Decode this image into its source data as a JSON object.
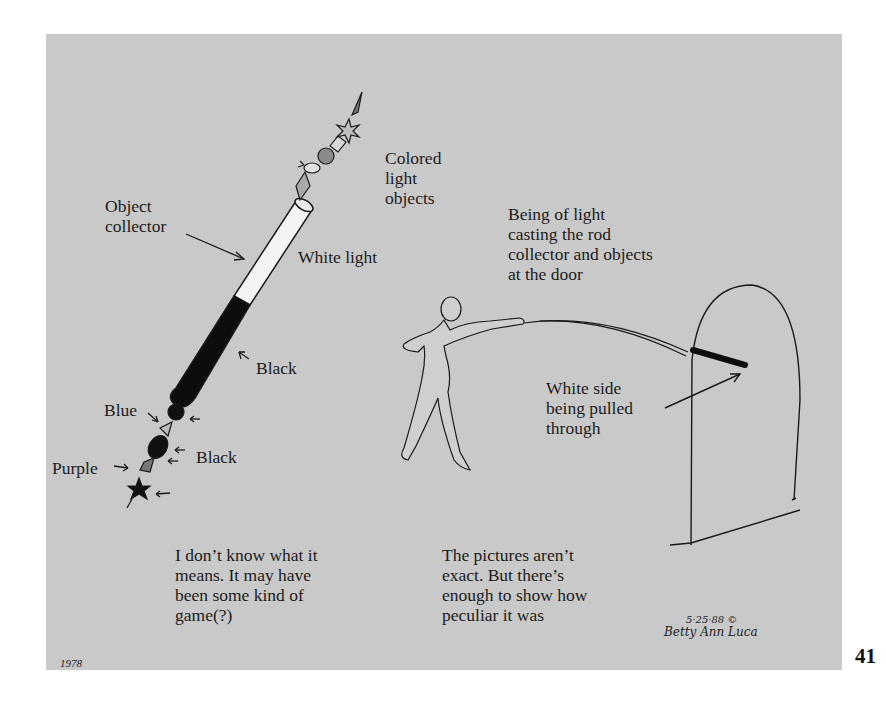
{
  "page": {
    "page_number": "41",
    "panel_color": "#c9c9c9"
  },
  "illustration": {
    "labels": {
      "colored_light_objects": "Colored\nlight\nobjects",
      "object_collector": "Object\ncollector",
      "white_light": "White light",
      "black_upper": "Black",
      "blue": "Blue",
      "black_lower": "Black",
      "purple": "Purple",
      "being_of_light": "Being of light\ncasting the rod\ncollector and objects\nat the door",
      "white_side": "White side\nbeing pulled\nthrough"
    },
    "captions": {
      "left": "I don’t know what it\nmeans. It may have\nbeen some kind of\ngame(?)",
      "right": "The pictures aren’t\nexact. But there’s\nenough to show how\npeculiar it was"
    },
    "year": "1978",
    "signature": {
      "date": "5·25·88 ©",
      "name": "Betty Ann Luca"
    }
  }
}
